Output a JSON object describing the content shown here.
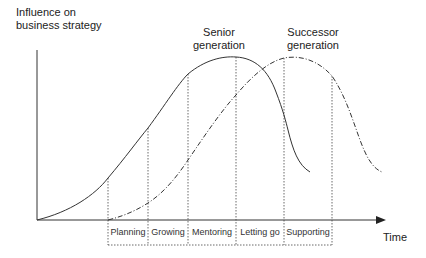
{
  "diagram": {
    "y_axis_label_line1": "Influence on",
    "y_axis_label_line2": "business strategy",
    "x_axis_label": "Time",
    "series": [
      {
        "name_line1": "Senior",
        "name_line2": "generation",
        "style": "solid"
      },
      {
        "name_line1": "Successor",
        "name_line2": "generation",
        "style": "dash-dot"
      }
    ],
    "phases": [
      "Planning",
      "Growing",
      "Mentoring",
      "Letting go",
      "Supporting"
    ],
    "colors": {
      "line": "#333333",
      "background": "#ffffff"
    }
  }
}
